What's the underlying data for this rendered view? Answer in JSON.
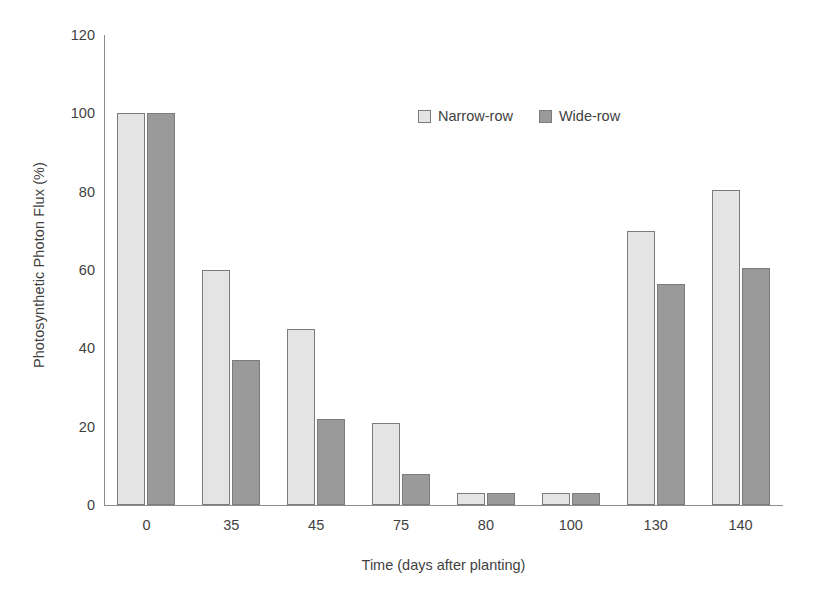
{
  "chart_data": {
    "type": "bar",
    "title": "",
    "subtitle": "",
    "xlabel": "Time (days after planting)",
    "ylabel": "Photosynthetic Photon Flux (%)",
    "categories": [
      "0",
      "35",
      "45",
      "75",
      "80",
      "100",
      "130",
      "140"
    ],
    "series": [
      {
        "name": "Narrow-row",
        "color": "#e4e4e4",
        "values": [
          100,
          60,
          45,
          21,
          3,
          3,
          70,
          80.5
        ]
      },
      {
        "name": "Wide-row",
        "color": "#9a9a9a",
        "values": [
          100,
          37,
          22,
          8,
          3,
          3,
          56.5,
          60.5
        ]
      }
    ],
    "ylim": [
      0,
      120
    ],
    "yticks": [
      0,
      20,
      40,
      60,
      80,
      100,
      120
    ],
    "ytick_labels": [
      "0",
      "20",
      "40",
      "60",
      "80",
      "100",
      "120"
    ],
    "grid": false,
    "legend_position": "upper center",
    "bar_edge_color": "#7b7b7b",
    "axis_color": "#8d8d8d",
    "text_color": "#3f3f3f"
  },
  "legend": {
    "entries": [
      {
        "label": "Narrow-row"
      },
      {
        "label": "Wide-row"
      }
    ]
  }
}
